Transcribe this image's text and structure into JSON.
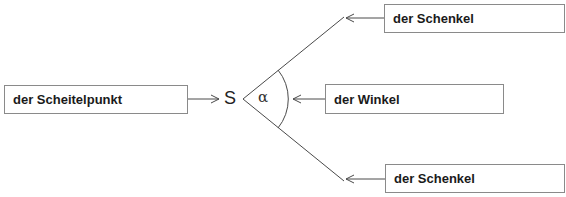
{
  "diagram": {
    "vertex_label": "S",
    "angle_label": "α",
    "labels": {
      "vertex": "der Scheitelpunkt",
      "leg_top": "der Schenkel",
      "angle": "der Winkel",
      "leg_bottom": "der Schenkel"
    },
    "colors": {
      "line": "#4a4a4a",
      "box_border": "#8a8a8a",
      "text": "#1a1a1a"
    }
  }
}
